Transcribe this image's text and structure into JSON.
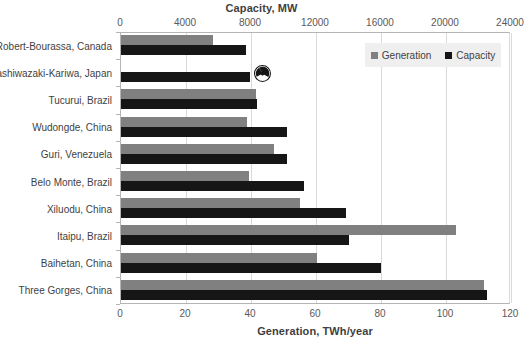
{
  "chart_data": {
    "type": "bar",
    "orientation": "horizontal",
    "title": "",
    "top_axis": {
      "label": "Capacity, MW",
      "ticks": [
        0,
        4000,
        8000,
        12000,
        16000,
        20000,
        24000
      ],
      "lim": [
        0,
        24000
      ]
    },
    "bottom_axis": {
      "label": "Generation, TWh/year",
      "ticks": [
        0,
        20,
        40,
        60,
        80,
        100,
        120
      ],
      "lim": [
        0,
        120
      ]
    },
    "ylabel": "",
    "grid": true,
    "legend_position": "top-right",
    "categories": [
      "Robert-Bourassa, Canada",
      "Kashiwazaki-Kariwa, Japan",
      "Tucurui, Brazil",
      "Wudongde, China",
      "Guri, Venezuela",
      "Belo Monte, Brazil",
      "Xiluodu, China",
      "Itaipu, Brazil",
      "Baihetan, China",
      "Three Gorges, China"
    ],
    "series": [
      {
        "name": "Generation",
        "unit": "TWh/year",
        "color": "#808080",
        "values": [
          28.3,
          0,
          41.5,
          38.9,
          47.0,
          39.5,
          55.2,
          103.1,
          60.2,
          111.8
        ]
      },
      {
        "name": "Capacity",
        "unit": "MW",
        "color": "#161616",
        "values": [
          7722,
          7965,
          8370,
          10200,
          10235,
          11233,
          13860,
          14000,
          16000,
          22500
        ]
      }
    ],
    "annotations": [
      {
        "name": "nuclear-icon",
        "glyph": "☢",
        "category": "Kashiwazaki-Kariwa, Japan",
        "note": "nuclear power station marker"
      }
    ]
  },
  "legend": {
    "items": [
      {
        "label": "Generation",
        "color": "#808080"
      },
      {
        "label": "Capacity",
        "color": "#161616"
      }
    ]
  }
}
